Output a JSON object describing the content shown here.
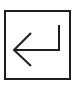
{
  "key": {
    "label": "Enter",
    "icon": "enter-return-icon",
    "border_color": "#1e1e1e",
    "stroke_color": "#1e1e1e"
  }
}
